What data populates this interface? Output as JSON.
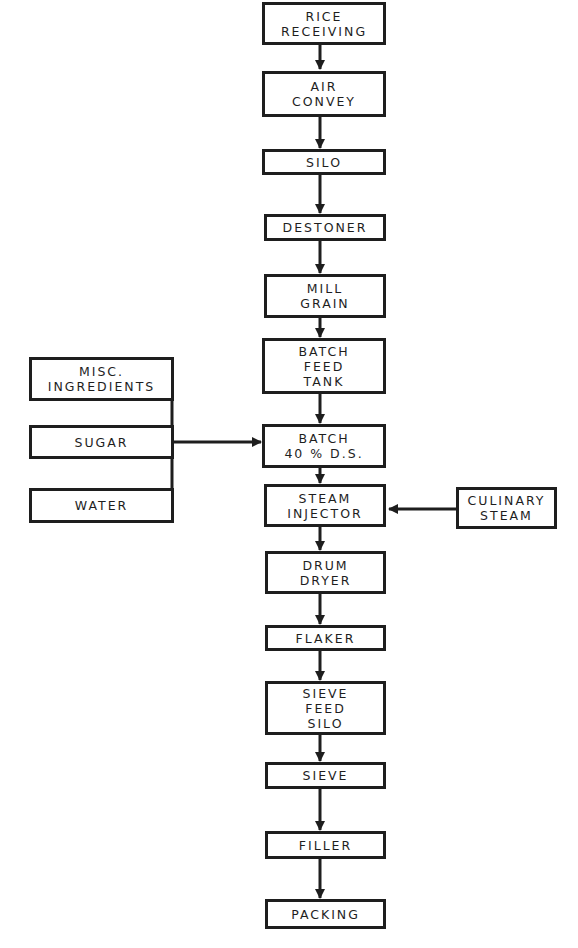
{
  "diagram": {
    "type": "process-flowchart",
    "main_flow": [
      {
        "id": "rice_receiving",
        "lines": [
          "RICE",
          "RECEIVING"
        ]
      },
      {
        "id": "air_convey",
        "lines": [
          "AIR",
          "CONVEY"
        ]
      },
      {
        "id": "silo",
        "lines": [
          "SILO"
        ]
      },
      {
        "id": "destoner",
        "lines": [
          "DESTONER"
        ]
      },
      {
        "id": "mill_grain",
        "lines": [
          "MILL",
          "GRAIN"
        ]
      },
      {
        "id": "batch_feed_tank",
        "lines": [
          "BATCH",
          "FEED",
          "TANK"
        ]
      },
      {
        "id": "batch",
        "lines": [
          "BATCH",
          "40 % D.S."
        ]
      },
      {
        "id": "steam_injector",
        "lines": [
          "STEAM",
          "INJECTOR"
        ]
      },
      {
        "id": "drum_dryer",
        "lines": [
          "DRUM",
          "DRYER"
        ]
      },
      {
        "id": "flaker",
        "lines": [
          "FLAKER"
        ]
      },
      {
        "id": "sieve_feed_silo",
        "lines": [
          "SIEVE",
          "FEED",
          "SILO"
        ]
      },
      {
        "id": "sieve",
        "lines": [
          "SIEVE"
        ]
      },
      {
        "id": "filler",
        "lines": [
          "FILLER"
        ]
      },
      {
        "id": "packing",
        "lines": [
          "PACKING"
        ]
      }
    ],
    "left_inputs": [
      {
        "id": "misc_ingredients",
        "lines": [
          "MISC.",
          "INGREDIENTS"
        ]
      },
      {
        "id": "sugar",
        "lines": [
          "SUGAR"
        ]
      },
      {
        "id": "water",
        "lines": [
          "WATER"
        ]
      }
    ],
    "left_inputs_target": "batch",
    "right_input": {
      "id": "culinary_steam",
      "lines": [
        "CULINARY",
        "STEAM"
      ]
    },
    "right_input_target": "steam_injector",
    "line_color": "#1e1e1e"
  }
}
